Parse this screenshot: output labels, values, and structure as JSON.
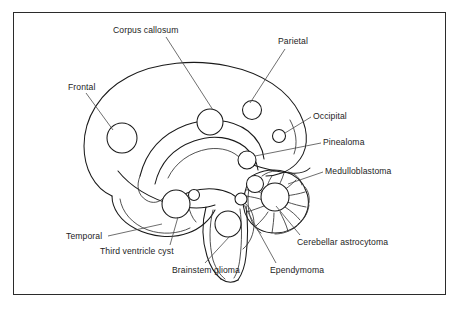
{
  "figure": {
    "type": "anatomical-diagram",
    "border_color": "#2b2b2b",
    "line_color": "#1a1a1a",
    "background_color": "#ffffff"
  },
  "labels": [
    {
      "id": "frontal",
      "text": "Frontal",
      "x": 68,
      "y": 88,
      "target_x": 113,
      "target_y": 130
    },
    {
      "id": "corpus-callosum",
      "text": "Corpus callosum",
      "x": 113,
      "y": 31,
      "target_x": 213,
      "target_y": 112
    },
    {
      "id": "parietal",
      "text": "Parietal",
      "x": 278,
      "y": 42,
      "target_x": 250,
      "target_y": 104
    },
    {
      "id": "occipital",
      "text": "Occipital",
      "x": 313,
      "y": 114,
      "target_x": 282,
      "target_y": 134
    },
    {
      "id": "pinealoma",
      "text": "Pinealoma",
      "x": 323,
      "y": 140,
      "target_x": 251,
      "target_y": 158
    },
    {
      "id": "medulloblastoma",
      "text": "Medulloblastoma",
      "x": 325,
      "y": 169,
      "target_x": 282,
      "target_y": 184
    },
    {
      "id": "cerebellar-astrocytoma",
      "text": "Cerebellar astrocytoma",
      "x": 297,
      "y": 240,
      "target_x": 275,
      "target_y": 200
    },
    {
      "id": "ependymoma",
      "text": "Ependymoma",
      "x": 270,
      "y": 268,
      "target_x": 243,
      "target_y": 205
    },
    {
      "id": "brainstem-glioma",
      "text": "Brainstem glioma",
      "x": 172,
      "y": 268,
      "target_x": 229,
      "target_y": 219
    },
    {
      "id": "third-ventricle-cyst",
      "text": "Third ventricle cyst",
      "x": 100,
      "y": 249,
      "target_x": 177,
      "target_y": 209
    },
    {
      "id": "temporal",
      "text": "Temporal",
      "x": 66,
      "y": 234,
      "target_x": 157,
      "target_y": 222
    }
  ]
}
